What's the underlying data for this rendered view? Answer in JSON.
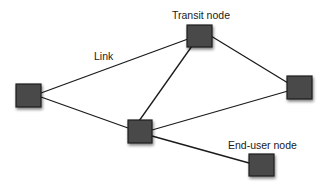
{
  "colors": {
    "node_fill": "#4a4a4a",
    "node_border": "#1e1e1e",
    "link": "#1a1a1a",
    "shadow": "#000000",
    "background": "#ffffff",
    "text": "#1a1a1a"
  },
  "labels": {
    "transit": {
      "text": "Transit node",
      "x": 172,
      "y": 10
    },
    "link": {
      "text": "Link",
      "x": 94,
      "y": 51
    },
    "end_user": {
      "text": "End-user node",
      "x": 228,
      "y": 140
    }
  },
  "nodes": [
    {
      "id": "left",
      "x": 16,
      "y": 84,
      "w": 25,
      "h": 23
    },
    {
      "id": "top",
      "x": 187,
      "y": 25,
      "w": 25,
      "h": 22
    },
    {
      "id": "right",
      "x": 287,
      "y": 76,
      "w": 25,
      "h": 23
    },
    {
      "id": "center",
      "x": 128,
      "y": 120,
      "w": 24,
      "h": 23
    },
    {
      "id": "bottom-right",
      "x": 249,
      "y": 154,
      "w": 25,
      "h": 22
    }
  ],
  "links": [
    {
      "from": "left",
      "to": "top",
      "x1": 41,
      "y1": 93,
      "x2": 188,
      "y2": 39
    },
    {
      "from": "left",
      "to": "center",
      "x1": 41,
      "y1": 97,
      "x2": 128,
      "y2": 128
    },
    {
      "from": "top",
      "to": "center",
      "x1": 192,
      "y1": 46,
      "x2": 139,
      "y2": 121
    },
    {
      "from": "top",
      "to": "right",
      "x1": 211,
      "y1": 36,
      "x2": 288,
      "y2": 83
    },
    {
      "from": "center",
      "to": "right",
      "x1": 152,
      "y1": 130,
      "x2": 288,
      "y2": 91
    },
    {
      "from": "center",
      "to": "bottom-right",
      "x1": 152,
      "y1": 136,
      "x2": 249,
      "y2": 163
    }
  ]
}
